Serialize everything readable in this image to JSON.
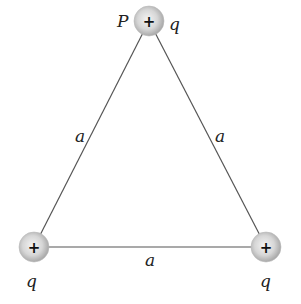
{
  "diagram": {
    "charges": [
      {
        "id": "top",
        "sign": "+",
        "label": "q",
        "point_label": "P"
      },
      {
        "id": "bottom-left",
        "sign": "+",
        "label": "q"
      },
      {
        "id": "bottom-right",
        "sign": "+",
        "label": "q"
      }
    ],
    "sides": [
      {
        "id": "left",
        "label": "a"
      },
      {
        "id": "right",
        "label": "a"
      },
      {
        "id": "bottom",
        "label": "a"
      }
    ],
    "colors": {
      "line": "#555555",
      "sphere": "#cfcfcf",
      "text": "#222222"
    }
  }
}
